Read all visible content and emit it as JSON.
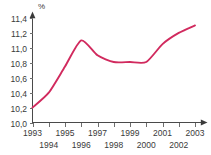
{
  "chart_data": {
    "type": "line",
    "title": "",
    "subtitle": "",
    "xlabel": "",
    "ylabel": "%",
    "y_unit_label": "%",
    "x": [
      1993,
      1994,
      1995,
      1996,
      1997,
      1998,
      1999,
      2000,
      2001,
      2002,
      2003
    ],
    "categories": [
      "1993",
      "1994",
      "1995",
      "1996",
      "1997",
      "1998",
      "1999",
      "2000",
      "2001",
      "2002",
      "2003"
    ],
    "values": [
      10.2,
      10.4,
      10.75,
      11.1,
      10.9,
      10.81,
      10.81,
      10.81,
      11.05,
      11.2,
      11.3
    ],
    "series": [
      {
        "name": "",
        "values": [
          10.2,
          10.4,
          10.75,
          11.1,
          10.9,
          10.81,
          10.81,
          10.81,
          11.05,
          11.2,
          11.3
        ],
        "color": "#d12a5e"
      }
    ],
    "ylim": [
      10.0,
      11.4
    ],
    "xlim": [
      1993,
      2003
    ],
    "ytick_values": [
      10.0,
      10.2,
      10.4,
      10.6,
      10.8,
      11.0,
      11.2,
      11.4
    ],
    "ytick_labels": [
      "10,0",
      "10,2",
      "10,4",
      "10,6",
      "10,8",
      "11,0",
      "11,2",
      "11,4"
    ],
    "xtick_values": [
      1993,
      1994,
      1995,
      1996,
      1997,
      1998,
      1999,
      2000,
      2001,
      2002,
      2003
    ],
    "xtick_labels_upper_row": [
      "1993",
      "",
      "1995",
      "",
      "1997",
      "",
      "1999",
      "",
      "2001",
      "",
      "2003"
    ],
    "xtick_labels_lower_row": [
      "",
      "1994",
      "",
      "1996",
      "",
      "1998",
      "",
      "2000",
      "",
      "2002",
      ""
    ],
    "grid": false,
    "legend": false,
    "legend_position": "none",
    "decimal_separator": ",",
    "axis_arrows": true,
    "line_color": "#d12a5e",
    "axis_color": "#4a4a4a",
    "text_color": "#3a3a3a",
    "background_color": "#ffffff"
  }
}
